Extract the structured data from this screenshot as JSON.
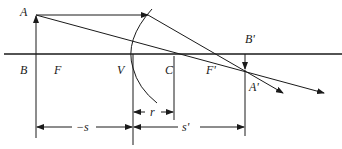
{
  "diagram": {
    "type": "ray-optics",
    "colors": {
      "ink": "#1a1a1a",
      "background": "#ffffff"
    },
    "labels": {
      "A": "A",
      "B": "B",
      "F": "F",
      "V": "V",
      "C": "C",
      "F_prime": "F'",
      "B_prime": "B'",
      "A_prime": "A'",
      "r": "r",
      "minus_s": "−s",
      "s_prime": "s'"
    },
    "points": {
      "A": [
        36,
        15
      ],
      "B": [
        36,
        54
      ],
      "V": [
        133,
        54
      ],
      "C": [
        174,
        54
      ],
      "F": [
        60,
        54
      ],
      "F_prime": [
        208,
        54
      ],
      "B_prime": [
        245,
        54
      ],
      "A_prime": [
        245,
        70
      ]
    },
    "dimensions": [
      {
        "name": "r",
        "from": "V",
        "to": "C"
      },
      {
        "name": "minus_s",
        "from": "B",
        "to": "V"
      },
      {
        "name": "s_prime",
        "from": "V",
        "to": "B_prime"
      }
    ]
  }
}
